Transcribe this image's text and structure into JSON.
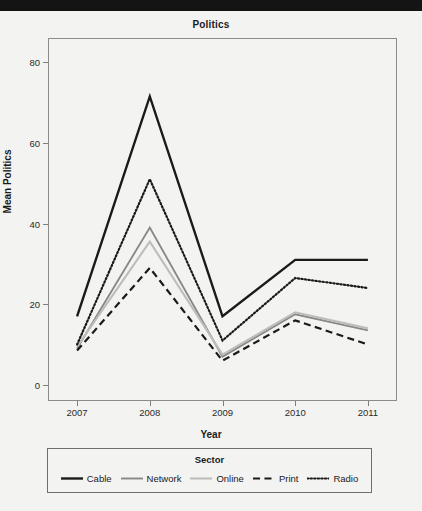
{
  "window": {
    "topbar_color": "#141414",
    "background_color": "#f3f3f1"
  },
  "chart_data": {
    "type": "line",
    "title": "Politics",
    "xlabel": "Year",
    "ylabel": "Mean Politics",
    "categories": [
      "2007",
      "2008",
      "2009",
      "2010",
      "2011"
    ],
    "x": [
      2007,
      2008,
      2009,
      2010,
      2011
    ],
    "xlim": [
      2006.6,
      2011.4
    ],
    "ylim": [
      -4,
      86
    ],
    "yticks": [
      0,
      20,
      40,
      60,
      80
    ],
    "ytick_labels": [
      "0",
      "20",
      "40",
      "60",
      "80"
    ],
    "xtick_labels": [
      "2007",
      "2008",
      "2009",
      "2010",
      "2011"
    ],
    "grid": false,
    "legend_position": "bottom",
    "legend_title": "Sector",
    "series": [
      {
        "name": "Cable",
        "values": [
          17,
          71.5,
          17,
          31,
          31
        ],
        "color": "#1a1a1a",
        "style": "solid",
        "width": 2.4
      },
      {
        "name": "Network",
        "values": [
          9,
          39,
          7,
          17.5,
          13.5
        ],
        "color": "#888888",
        "style": "solid",
        "width": 1.9
      },
      {
        "name": "Online",
        "values": [
          9.5,
          35.5,
          7.5,
          18,
          14
        ],
        "color": "#bdbdbd",
        "style": "solid",
        "width": 2.1
      },
      {
        "name": "Print",
        "values": [
          8.5,
          29,
          6,
          16,
          10
        ],
        "color": "#1a1a1a",
        "style": "dashed",
        "width": 2.2
      },
      {
        "name": "Radio",
        "values": [
          10,
          51,
          11,
          26.5,
          24
        ],
        "color": "#1a1a1a",
        "style": "dotted",
        "width": 2.2
      }
    ]
  }
}
